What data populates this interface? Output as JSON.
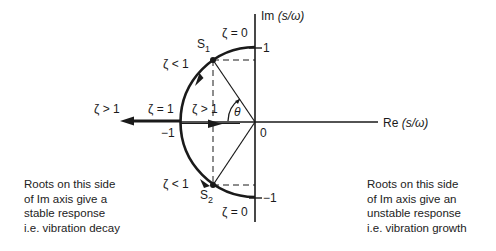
{
  "axes": {
    "im_label": "Im",
    "im_unit": "(s/ω)",
    "re_label": "Re",
    "re_unit": "(s/ω)",
    "tick_im_pos": "1",
    "tick_im_neg": "−1",
    "tick_re_neg": "−1",
    "origin": "0"
  },
  "roots": {
    "s1": {
      "letter": "S",
      "sub": "1"
    },
    "s2": {
      "letter": "S",
      "sub": "2"
    }
  },
  "zeta_labels": {
    "top_zero": "ζ = 0",
    "bottom_zero": "ζ = 0",
    "upper_lt1": "ζ < 1",
    "lower_lt1": "ζ < 1",
    "gt1_far": "ζ > 1",
    "eq1": "ζ = 1",
    "gt1_inner": "ζ > 1",
    "angle": "θ"
  },
  "notes": {
    "left": [
      "Roots on this side",
      "of Im axis give a",
      "stable response",
      "i.e. vibration decay"
    ],
    "right": [
      "Roots on this side",
      "of Im axis give an",
      "unstable response",
      "i.e. vibration growth"
    ]
  },
  "colors": {
    "ink": "#1a1a1a",
    "background": "#ffffff"
  }
}
